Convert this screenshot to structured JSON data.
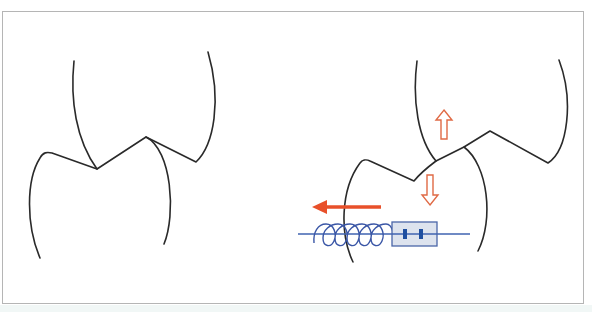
{
  "figure": {
    "type": "gear-tooth-mesh-diagram",
    "panels": [
      {
        "id": "left",
        "description": "Two meshing gear teeth, upper and lower, in contact"
      },
      {
        "id": "right",
        "description": "Meshing gear teeth with vertical separation arrows and spring-loaded anti-backlash element"
      }
    ],
    "colors": {
      "outline": "#2a2a2a",
      "arrow_red": "#e8502a",
      "arrow_outline": "#e06a45",
      "spring_blue": "#3a56a6",
      "axis_blue": "#3f63b0",
      "box_fill": "#dde3ee",
      "box_stroke": "#4a66a8",
      "pin_blue": "#1f4fa0",
      "frame": "#b5b5b5"
    },
    "icons": {
      "up_arrow": "hollow-up-arrow-icon",
      "down_arrow": "hollow-down-arrow-icon",
      "force_arrow": "solid-left-arrow-icon",
      "spring": "coil-spring-icon"
    }
  }
}
